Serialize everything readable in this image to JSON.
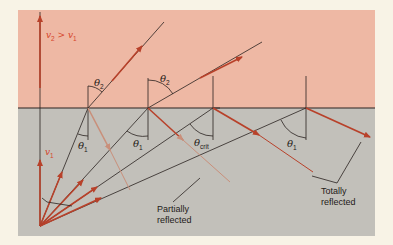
{
  "diagram": {
    "colors": {
      "background": "#f8f3e6",
      "upper_medium": "#eeb8a4",
      "lower_medium": "#c2c0ba",
      "ray": "#b8412a",
      "line": "#2a2220",
      "partial_ray": "#c98f7a"
    },
    "labels": {
      "velocity_relation": "v",
      "v2_sub": "2",
      "gt": " > ",
      "v1_after": "v",
      "v1_sub": "1",
      "v1_label": "v",
      "v1_label_sub": "1",
      "theta": "θ",
      "theta2_sub": "2",
      "theta1_sub": "1",
      "theta_crit_sub": "crit",
      "partially_line1": "Partially",
      "partially_line2": "reflected",
      "totally_line1": "Totally",
      "totally_line2": "reflected"
    }
  }
}
